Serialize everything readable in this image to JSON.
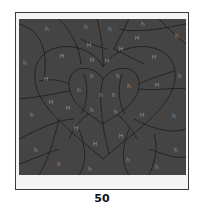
{
  "puzzle": {
    "panel_color": "#444444",
    "line_color": "#1c1c1c",
    "label_color": "#8f8f8f",
    "labels": [
      {
        "t": "h",
        "x": 28,
        "y": 10
      },
      {
        "t": "h",
        "x": 67,
        "y": 8
      },
      {
        "t": "h",
        "x": 91,
        "y": 10
      },
      {
        "t": "h",
        "x": 124,
        "y": 5
      },
      {
        "t": "h",
        "x": 158,
        "y": 17
      },
      {
        "t": "h",
        "x": 6,
        "y": 44
      },
      {
        "t": "H",
        "x": 43,
        "y": 37
      },
      {
        "t": "H",
        "x": 70,
        "y": 26
      },
      {
        "t": "H",
        "x": 118,
        "y": 19
      },
      {
        "t": "H",
        "x": 102,
        "y": 30
      },
      {
        "t": "H",
        "x": 135,
        "y": 38
      },
      {
        "t": "H",
        "x": 73,
        "y": 41
      },
      {
        "t": "H",
        "x": 88,
        "y": 42
      },
      {
        "t": "H",
        "x": 27,
        "y": 60
      },
      {
        "t": "h",
        "x": 73,
        "y": 57
      },
      {
        "t": "h",
        "x": 99,
        "y": 57
      },
      {
        "t": "h",
        "x": 110,
        "y": 67
      },
      {
        "t": "H",
        "x": 138,
        "y": 66
      },
      {
        "t": "h",
        "x": 161,
        "y": 57
      },
      {
        "t": "h",
        "x": 60,
        "y": 71
      },
      {
        "t": "h",
        "x": 82,
        "y": 76
      },
      {
        "t": "h",
        "x": 95,
        "y": 76
      },
      {
        "t": "H",
        "x": 32,
        "y": 83
      },
      {
        "t": "H",
        "x": 49,
        "y": 89
      },
      {
        "t": "h",
        "x": 13,
        "y": 96
      },
      {
        "t": "h",
        "x": 73,
        "y": 91
      },
      {
        "t": "h",
        "x": 97,
        "y": 93
      },
      {
        "t": "H",
        "x": 123,
        "y": 96
      },
      {
        "t": "h",
        "x": 155,
        "y": 97
      },
      {
        "t": "H",
        "x": 57,
        "y": 109
      },
      {
        "t": "H",
        "x": 102,
        "y": 117
      },
      {
        "t": "H",
        "x": 76,
        "y": 125
      },
      {
        "t": "h",
        "x": 17,
        "y": 131
      },
      {
        "t": "h",
        "x": 157,
        "y": 131
      },
      {
        "t": "h",
        "x": 40,
        "y": 145
      },
      {
        "t": "h",
        "x": 109,
        "y": 141
      },
      {
        "t": "h",
        "x": 71,
        "y": 150
      },
      {
        "t": "h",
        "x": 138,
        "y": 148
      }
    ]
  },
  "page": {
    "number": "50"
  }
}
